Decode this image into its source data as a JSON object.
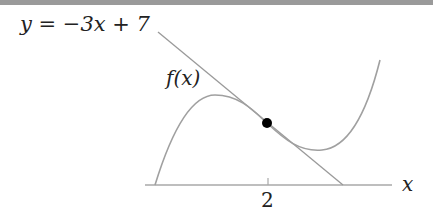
{
  "diagram": {
    "tangent_label": "y = −3x + 7",
    "function_label": "f(x)",
    "axis_label": "x",
    "tick_label": "2",
    "colors": {
      "curve": "#a0a0a0",
      "tangent": "#9a9a9a",
      "axis": "#a8a8a8",
      "point": "#000000",
      "text": "#222222"
    }
  }
}
